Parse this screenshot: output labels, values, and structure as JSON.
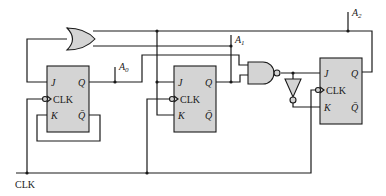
{
  "diagram": {
    "type": "sequential logic circuit (3-bit counter with JK flip-flops)",
    "signals": {
      "a0": {
        "base": "A",
        "sub": "0"
      },
      "a1": {
        "base": "A",
        "sub": "1"
      },
      "a2": {
        "base": "A",
        "sub": "2"
      },
      "clock": "CLK"
    },
    "flip_flops": [
      {
        "id": "ff0",
        "pins": {
          "j": "J",
          "k": "K",
          "clk": "CLK",
          "q": "Q",
          "qbar": "Q̄"
        }
      },
      {
        "id": "ff1",
        "pins": {
          "j": "J",
          "k": "K",
          "clk": "CLK",
          "q": "Q",
          "qbar": "Q̄"
        }
      },
      {
        "id": "ff2",
        "pins": {
          "j": "J",
          "k": "K",
          "clk": "CLK",
          "q": "Q",
          "qbar": "Q̄"
        }
      }
    ],
    "gates": [
      {
        "id": "or-gate",
        "type": "OR",
        "inputs": [
          "A1",
          "A2"
        ],
        "output": "FF0 J"
      },
      {
        "id": "nand-gate",
        "type": "NAND",
        "inputs": [
          "A0",
          "A1"
        ],
        "output": "FF2 J"
      },
      {
        "id": "inverter",
        "type": "NOT",
        "input": "NAND out",
        "output": "FF2 K"
      }
    ],
    "colors": {
      "fill": "#d4d4d4",
      "line": "#1a1a1a",
      "background": "#ffffff"
    }
  }
}
